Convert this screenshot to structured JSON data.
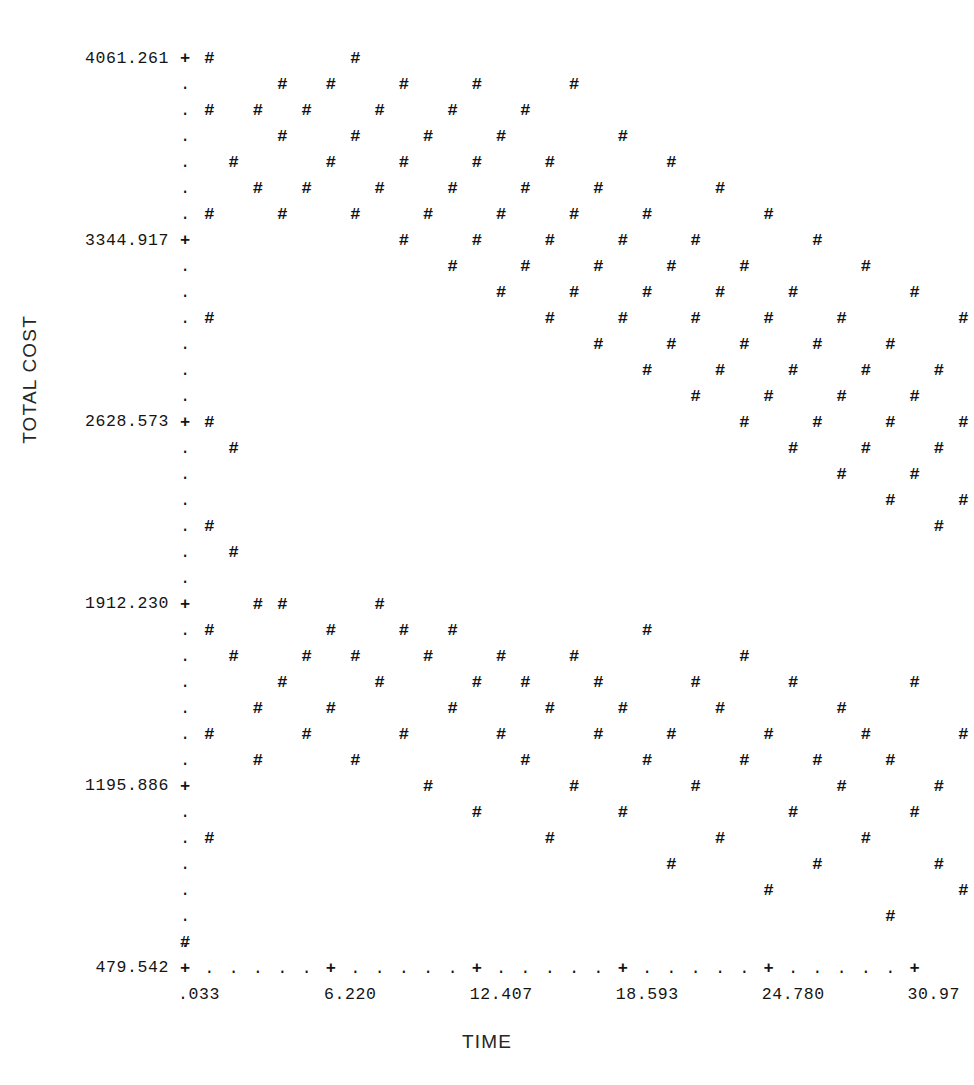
{
  "chart_data": {
    "type": "scatter",
    "title": "",
    "xlabel": "TIME",
    "ylabel": "TOTAL COST",
    "marker_glyph": "#",
    "major_tick_glyph": "+",
    "minor_tick_glyph": ".",
    "grid": false,
    "legend": null,
    "xtick_labels": [
      ".033",
      "6.220",
      "12.407",
      "18.593",
      "24.780",
      "30.97"
    ],
    "xtick_values": [
      0.033,
      6.22,
      12.407,
      18.593,
      24.78,
      30.97
    ],
    "ytick_labels": [
      "479.542",
      "1195.886",
      "1912.230",
      "2628.573",
      "3344.917",
      "4061.261"
    ],
    "ytick_values": [
      479.542,
      1195.886,
      1912.23,
      2628.573,
      3344.917,
      4061.261
    ],
    "xlim": [
      0.033,
      30.97
    ],
    "ylim": [
      479.542,
      4061.261
    ],
    "minor_ticks_between_x_majors": 5,
    "minor_ticks_between_y_majors": 6,
    "n_points": 196,
    "note": "Line-printer character plot: each '#' is one plotted observation on a character cell grid; four rising cost trajectories versus time.",
    "points_grid": [
      [
        0,
        1
      ],
      [
        1,
        5
      ],
      [
        1,
        9
      ],
      [
        1,
        13
      ],
      [
        1,
        17
      ],
      [
        1,
        21
      ],
      [
        1,
        25
      ],
      [
        1,
        29
      ],
      [
        1,
        33
      ],
      [
        1,
        35
      ],
      [
        2,
        12
      ],
      [
        2,
        16
      ],
      [
        2,
        20
      ],
      [
        2,
        31
      ],
      [
        3,
        8
      ],
      [
        3,
        10
      ],
      [
        3,
        14
      ],
      [
        3,
        30
      ],
      [
        3,
        33
      ],
      [
        4,
        11
      ],
      [
        4,
        14
      ],
      [
        4,
        29
      ],
      [
        4,
        32
      ],
      [
        4,
        34
      ],
      [
        5,
        9
      ],
      [
        5,
        12
      ],
      [
        5,
        30
      ],
      [
        5,
        33
      ],
      [
        6,
        10
      ],
      [
        6,
        13
      ],
      [
        6,
        31
      ],
      [
        6,
        34
      ],
      [
        7,
        8
      ],
      [
        7,
        12
      ],
      [
        7,
        29
      ],
      [
        7,
        32
      ],
      [
        7,
        35
      ],
      [
        8,
        11
      ],
      [
        8,
        14
      ],
      [
        8,
        30
      ],
      [
        8,
        33
      ],
      [
        9,
        9
      ],
      [
        9,
        13
      ],
      [
        9,
        28
      ],
      [
        9,
        31
      ],
      [
        9,
        34
      ],
      [
        10,
        7
      ],
      [
        10,
        12
      ],
      [
        10,
        29
      ],
      [
        10,
        32
      ],
      [
        11,
        10
      ],
      [
        11,
        13
      ],
      [
        11,
        27
      ],
      [
        11,
        30
      ],
      [
        11,
        33
      ],
      [
        12,
        6
      ],
      [
        12,
        11
      ],
      [
        12,
        28
      ],
      [
        12,
        31
      ],
      [
        12,
        34
      ],
      [
        13,
        9
      ],
      [
        13,
        12
      ],
      [
        13,
        26
      ],
      [
        13,
        29
      ],
      [
        13,
        32
      ],
      [
        14,
        8
      ],
      [
        14,
        11
      ],
      [
        14,
        27
      ],
      [
        14,
        30
      ],
      [
        14,
        33
      ],
      [
        15,
        5
      ],
      [
        15,
        10
      ],
      [
        15,
        25
      ],
      [
        15,
        28
      ],
      [
        15,
        31
      ],
      [
        16,
        7
      ],
      [
        16,
        12
      ],
      [
        16,
        26
      ],
      [
        16,
        29
      ],
      [
        16,
        34
      ],
      [
        17,
        9
      ],
      [
        17,
        11
      ],
      [
        17,
        24
      ],
      [
        17,
        27
      ],
      [
        17,
        30
      ],
      [
        18,
        6
      ],
      [
        18,
        10
      ],
      [
        18,
        25
      ],
      [
        18,
        28
      ],
      [
        18,
        32
      ],
      [
        19,
        8
      ],
      [
        19,
        13
      ],
      [
        19,
        23
      ],
      [
        19,
        26
      ],
      [
        19,
        29
      ],
      [
        20,
        4
      ],
      [
        20,
        9
      ],
      [
        20,
        24
      ],
      [
        20,
        27
      ],
      [
        20,
        31
      ],
      [
        21,
        7
      ],
      [
        21,
        11
      ],
      [
        21,
        22
      ],
      [
        21,
        25
      ],
      [
        21,
        28
      ],
      [
        22,
        5
      ],
      [
        22,
        10
      ],
      [
        22,
        23
      ],
      [
        22,
        26
      ],
      [
        22,
        30
      ],
      [
        23,
        8
      ],
      [
        23,
        12
      ],
      [
        23,
        21
      ],
      [
        23,
        24
      ],
      [
        23,
        27
      ],
      [
        24,
        3
      ],
      [
        24,
        9
      ],
      [
        24,
        22
      ],
      [
        24,
        25
      ],
      [
        24,
        29
      ],
      [
        25,
        6
      ],
      [
        25,
        11
      ],
      [
        25,
        20
      ],
      [
        25,
        23
      ],
      [
        25,
        26
      ],
      [
        26,
        4
      ],
      [
        26,
        8
      ],
      [
        26,
        21
      ],
      [
        26,
        24
      ],
      [
        26,
        28
      ],
      [
        27,
        7
      ],
      [
        27,
        10
      ],
      [
        27,
        19
      ],
      [
        27,
        22
      ],
      [
        27,
        25
      ],
      [
        28,
        5
      ],
      [
        28,
        9
      ],
      [
        28,
        20
      ],
      [
        28,
        23
      ],
      [
        28,
        27
      ],
      [
        29,
        2
      ],
      [
        29,
        8
      ],
      [
        29,
        18
      ],
      [
        29,
        21
      ],
      [
        29,
        24
      ],
      [
        30,
        6
      ],
      [
        30,
        11
      ],
      [
        30,
        19
      ],
      [
        30,
        22
      ],
      [
        30,
        26
      ],
      [
        31,
        4
      ],
      [
        31,
        7
      ],
      [
        31,
        17
      ],
      [
        31,
        20
      ],
      [
        31,
        23
      ],
      [
        32,
        3
      ],
      [
        32,
        9
      ],
      [
        32,
        18
      ],
      [
        32,
        21
      ],
      [
        32,
        25
      ],
      [
        33,
        5
      ],
      [
        33,
        8
      ],
      [
        33,
        16
      ],
      [
        33,
        19
      ],
      [
        33,
        22
      ],
      [
        34,
        2
      ],
      [
        34,
        7
      ],
      [
        34,
        17
      ],
      [
        34,
        20
      ],
      [
        34,
        24
      ],
      [
        35,
        4
      ],
      [
        35,
        6
      ],
      [
        35,
        15
      ],
      [
        35,
        18
      ],
      [
        35,
        21
      ],
      [
        36,
        1
      ],
      [
        36,
        5
      ],
      [
        36,
        16
      ],
      [
        36,
        19
      ],
      [
        36,
        23
      ],
      [
        37,
        3
      ],
      [
        37,
        14
      ],
      [
        37,
        17
      ],
      [
        37,
        20
      ],
      [
        38,
        2
      ],
      [
        38,
        6
      ],
      [
        38,
        15
      ],
      [
        38,
        18
      ],
      [
        38,
        22
      ],
      [
        39,
        1
      ],
      [
        39,
        4
      ],
      [
        39,
        13
      ],
      [
        39,
        16
      ],
      [
        39,
        19
      ]
    ]
  }
}
